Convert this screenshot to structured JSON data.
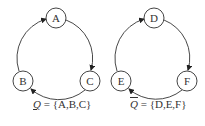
{
  "diagram": {
    "cycles": [
      {
        "id": "left",
        "nodes": [
          {
            "label": "A",
            "x": 56,
            "y": 18
          },
          {
            "label": "B",
            "x": 23,
            "y": 81
          },
          {
            "label": "C",
            "x": 90,
            "y": 81
          }
        ],
        "edges": [
          {
            "from": "A",
            "to": "C"
          },
          {
            "from": "C",
            "to": "B"
          },
          {
            "from": "B",
            "to": "A"
          }
        ],
        "set_symbol": "Q",
        "set_symbol_decoration": "underline",
        "set_equals": "= {A,B,C}"
      },
      {
        "id": "right",
        "nodes": [
          {
            "label": "D",
            "x": 154,
            "y": 18
          },
          {
            "label": "E",
            "x": 121,
            "y": 81
          },
          {
            "label": "F",
            "x": 187,
            "y": 81
          }
        ],
        "edges": [
          {
            "from": "D",
            "to": "F"
          },
          {
            "from": "F",
            "to": "E"
          },
          {
            "from": "E",
            "to": "D"
          }
        ],
        "set_symbol": "Q",
        "set_symbol_decoration": "overline",
        "set_equals": "= {D,E,F}"
      }
    ],
    "colors": {
      "stroke": "#333333",
      "background": "#ffffff"
    }
  }
}
